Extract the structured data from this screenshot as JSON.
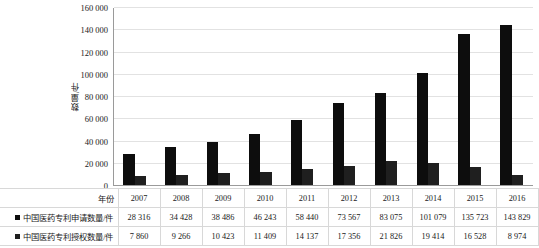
{
  "chart_data": {
    "type": "bar",
    "title": "",
    "xlabel": "年份",
    "ylabel": "数量/件",
    "categories": [
      "2007",
      "2008",
      "2009",
      "2010",
      "2011",
      "2012",
      "2013",
      "2014",
      "2015",
      "2016"
    ],
    "series": [
      {
        "name": "中国医药专利申请数量/件",
        "color": "#0d0d0d",
        "values": [
          28316,
          34428,
          38486,
          46243,
          58440,
          73567,
          83075,
          101079,
          135723,
          143829
        ],
        "value_labels": [
          "28 316",
          "34 428",
          "38 486",
          "46 243",
          "58 440",
          "73 567",
          "83 075",
          "101 079",
          "135 723",
          "143 829"
        ]
      },
      {
        "name": "中国医药专利授权数量/件",
        "color": "#1f1f1f",
        "values": [
          7860,
          9266,
          10423,
          11409,
          14137,
          17356,
          21826,
          19414,
          16528,
          8974
        ],
        "value_labels": [
          "7 860",
          "9 266",
          "10 423",
          "11 409",
          "14 137",
          "17 356",
          "21 826",
          "19 414",
          "16 528",
          "8 974"
        ]
      }
    ],
    "ylim": [
      0,
      160000
    ],
    "ytick_values": [
      0,
      20000,
      40000,
      60000,
      80000,
      100000,
      120000,
      140000,
      160000
    ],
    "ytick_labels": [
      "0",
      "20 000",
      "40 000",
      "60 000",
      "80 000",
      "100 000",
      "120 000",
      "140 000",
      "160 000"
    ],
    "grid": "horizontal",
    "legend_position": "table-row-headers"
  },
  "table": {
    "year_row_label": "年份",
    "rows": [
      {
        "label": "年份",
        "has_swatch": false
      },
      {
        "label": "中国医药专利申请数量/件",
        "has_swatch": true
      },
      {
        "label": "中国医药专利授权数量/件",
        "has_swatch": true
      }
    ]
  }
}
